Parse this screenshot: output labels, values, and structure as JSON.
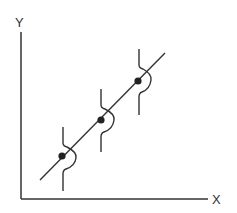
{
  "diagram": {
    "type": "regression-with-conditional-distributions",
    "axes": {
      "x_label": "X",
      "y_label": "Y"
    },
    "colors": {
      "stroke": "#333333",
      "point": "#222222",
      "background": "#ffffff"
    },
    "regression_line": {
      "from": [
        40,
        180
      ],
      "to": [
        165,
        53
      ]
    },
    "points": [
      {
        "cx": 62,
        "cy": 156
      },
      {
        "cx": 101,
        "cy": 120
      },
      {
        "cx": 138,
        "cy": 81
      }
    ]
  }
}
